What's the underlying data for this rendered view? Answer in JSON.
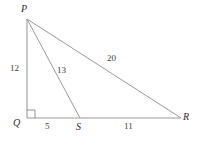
{
  "figure": {
    "type": "geometry-diagram",
    "width": 197,
    "height": 145,
    "background_color": "#ffffff",
    "stroke_color": "#9a9a9a",
    "text_color": "#2b2b2b"
  },
  "vertices": [
    {
      "name": "P",
      "label": "P",
      "x": 27,
      "y": 19,
      "label_x": 21,
      "label_y": 4
    },
    {
      "name": "Q",
      "label": "Q",
      "x": 27,
      "y": 118,
      "label_x": 13,
      "label_y": 118
    },
    {
      "name": "S",
      "label": "S",
      "x": 80,
      "y": 118,
      "label_x": 76,
      "label_y": 122
    },
    {
      "name": "R",
      "label": "R",
      "x": 181,
      "y": 118,
      "label_x": 183,
      "label_y": 112
    }
  ],
  "segments": [
    {
      "name": "PQ",
      "from": "P",
      "to": "Q",
      "x1": 27,
      "y1": 19,
      "x2": 27,
      "y2": 118
    },
    {
      "name": "QR",
      "from": "Q",
      "to": "R",
      "x1": 27,
      "y1": 118,
      "x2": 181,
      "y2": 118
    },
    {
      "name": "PR",
      "from": "P",
      "to": "R",
      "x1": 27,
      "y1": 19,
      "x2": 181,
      "y2": 118
    },
    {
      "name": "PS",
      "from": "P",
      "to": "S",
      "x1": 27,
      "y1": 19,
      "x2": 80,
      "y2": 118
    }
  ],
  "length_labels": [
    {
      "name": "PQ",
      "value": "12",
      "x": 10,
      "y": 64
    },
    {
      "name": "PS",
      "value": "13",
      "x": 57,
      "y": 66
    },
    {
      "name": "PR",
      "value": "20",
      "x": 107,
      "y": 54
    },
    {
      "name": "QS",
      "value": "5",
      "x": 45,
      "y": 122
    },
    {
      "name": "SR",
      "value": "11",
      "x": 124,
      "y": 122
    }
  ],
  "right_angle": {
    "at_vertex": "Q",
    "x": 27,
    "y": 110,
    "size": 8
  }
}
